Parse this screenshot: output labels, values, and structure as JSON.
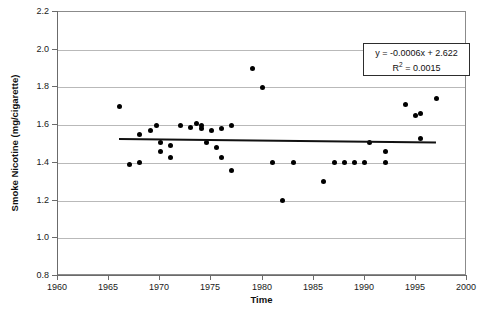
{
  "chart_data": {
    "type": "scatter",
    "title": "",
    "xlabel": "Time",
    "ylabel": "Smoke Nicotine (mg/cigarette)",
    "xlim": [
      1960,
      2000
    ],
    "ylim": [
      0.8,
      2.2
    ],
    "xticks": [
      1960,
      1965,
      1970,
      1975,
      1980,
      1985,
      1990,
      1995,
      2000
    ],
    "yticks": [
      0.8,
      1.0,
      1.2,
      1.4,
      1.6,
      1.8,
      2.0,
      2.2
    ],
    "xtick_labels": [
      "1960",
      "1965",
      "1970",
      "1975",
      "1980",
      "1985",
      "1990",
      "1995",
      "2000"
    ],
    "ytick_labels": [
      "0.8",
      "1.0",
      "1.2",
      "1.4",
      "1.6",
      "1.8",
      "2.0",
      "2.2"
    ],
    "grid": "horizontal",
    "legend": "none",
    "marker": "filled-circle",
    "marker_color": "#000000",
    "points": [
      {
        "x": 1966,
        "y": 1.7
      },
      {
        "x": 1967,
        "y": 1.39
      },
      {
        "x": 1968,
        "y": 1.4
      },
      {
        "x": 1968,
        "y": 1.55
      },
      {
        "x": 1969,
        "y": 1.57
      },
      {
        "x": 1969.6,
        "y": 1.6
      },
      {
        "x": 1970,
        "y": 1.51
      },
      {
        "x": 1970,
        "y": 1.46
      },
      {
        "x": 1971,
        "y": 1.43
      },
      {
        "x": 1971,
        "y": 1.49
      },
      {
        "x": 1972,
        "y": 1.6
      },
      {
        "x": 1973,
        "y": 1.59
      },
      {
        "x": 1973.5,
        "y": 1.61
      },
      {
        "x": 1974,
        "y": 1.6
      },
      {
        "x": 1974,
        "y": 1.58
      },
      {
        "x": 1974.5,
        "y": 1.51
      },
      {
        "x": 1975,
        "y": 1.57
      },
      {
        "x": 1975.5,
        "y": 1.48
      },
      {
        "x": 1976,
        "y": 1.43
      },
      {
        "x": 1976,
        "y": 1.58
      },
      {
        "x": 1977,
        "y": 1.6
      },
      {
        "x": 1977,
        "y": 1.36
      },
      {
        "x": 1979,
        "y": 1.9
      },
      {
        "x": 1980,
        "y": 1.8
      },
      {
        "x": 1981,
        "y": 1.4
      },
      {
        "x": 1982,
        "y": 1.2
      },
      {
        "x": 1983,
        "y": 1.4
      },
      {
        "x": 1986,
        "y": 1.3
      },
      {
        "x": 1987,
        "y": 1.4
      },
      {
        "x": 1988,
        "y": 1.4
      },
      {
        "x": 1989,
        "y": 1.4
      },
      {
        "x": 1990,
        "y": 1.4
      },
      {
        "x": 1990.5,
        "y": 1.51
      },
      {
        "x": 1992,
        "y": 1.4
      },
      {
        "x": 1992,
        "y": 1.46
      },
      {
        "x": 1994,
        "y": 1.71
      },
      {
        "x": 1995,
        "y": 1.65
      },
      {
        "x": 1995.5,
        "y": 1.66
      },
      {
        "x": 1995.5,
        "y": 1.53
      },
      {
        "x": 1997,
        "y": 1.74
      }
    ],
    "trendline": {
      "equation": "y = -0.0006x + 2.622",
      "r_squared_label": "R",
      "r_squared_exponent": "2",
      "r_squared_value": " = 0.0015",
      "slope": -0.0006,
      "intercept": 2.622,
      "r_squared": 0.0015,
      "x_start": 1966,
      "x_end": 1997,
      "y_start": 1.5324,
      "y_end": 1.5138,
      "color": "#111111"
    }
  },
  "annotation": {
    "equation_text": "y = -0.0006x + 2.622",
    "r2_prefix": "R",
    "r2_sup": "2",
    "r2_suffix": " = 0.0015"
  }
}
